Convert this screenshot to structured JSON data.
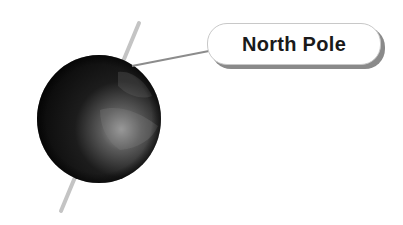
{
  "diagram": {
    "label": "North Pole",
    "colors": {
      "axis": "#c4c4c4",
      "connector": "#8c8c8c",
      "globe_dark": "#0c0c0c",
      "globe_light": "#9a9a9a",
      "label_shadow": "#8a8a8a"
    }
  }
}
